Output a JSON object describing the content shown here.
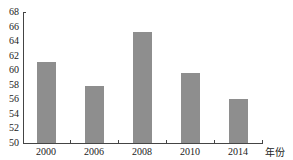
{
  "chart_data": {
    "type": "bar",
    "title": "",
    "xlabel": "年份",
    "ylabel": "",
    "categories": [
      "2000",
      "2006",
      "2008",
      "2010",
      "2014"
    ],
    "values": [
      61.1,
      57.9,
      65.2,
      59.6,
      56.1
    ],
    "ylim": [
      50,
      68
    ],
    "yticks": [
      50,
      52,
      54,
      56,
      58,
      60,
      62,
      64,
      66,
      68
    ],
    "grid": false,
    "legend": null,
    "bar_color": "#8e8e8e"
  },
  "axis": {
    "x_title": "年份",
    "y_tick_labels": [
      "68",
      "66",
      "64",
      "62",
      "60",
      "58",
      "56",
      "54",
      "52",
      "50"
    ],
    "x_tick_labels": [
      "2000",
      "2006",
      "2008",
      "2010",
      "2014"
    ]
  }
}
